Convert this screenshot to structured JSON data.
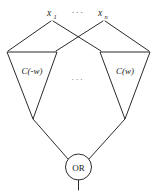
{
  "figure": {
    "background_color": "#ffffff",
    "line_color": "#2b2b2b",
    "text_color": "#1a1a1a",
    "width": 156,
    "height": 191
  },
  "inputs": {
    "first": {
      "base": "x",
      "subscript": "1",
      "full": "x1"
    },
    "ellipsis": "···",
    "last": {
      "base": "x",
      "subscript": "n",
      "full": "xn"
    }
  },
  "middle_ellipsis": "···",
  "modules": [
    {
      "id": "left-module",
      "label": "C(-w)",
      "shape": "inverted-triangle"
    },
    {
      "id": "right-module",
      "label": "C(w)",
      "shape": "inverted-triangle"
    }
  ],
  "output_gate": {
    "label": "OR",
    "shape": "circle"
  },
  "wires": {
    "count_from_inputs": 4,
    "count_to_gate": 2,
    "output_stub": true
  }
}
